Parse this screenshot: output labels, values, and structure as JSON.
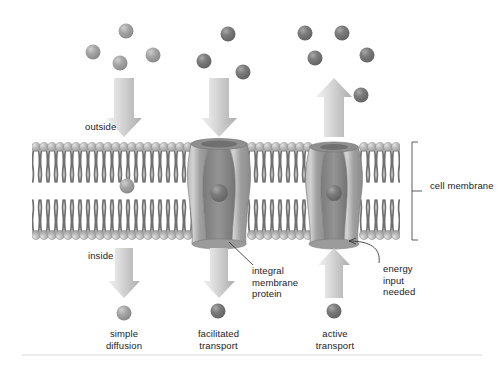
{
  "figure": {
    "background_color": "#ffffff"
  },
  "labels": {
    "outside": "outside",
    "inside": "inside",
    "cell_membrane": "cell membrane",
    "integral_membrane_protein": "integral\nmembrane\nprotein",
    "energy_input_needed": "energy\ninput\nneeded",
    "simple_diffusion": "simple\ndiffusion",
    "facilitated_transport": "facilitated\ntransport",
    "active_transport": "active\ntransport"
  },
  "colors": {
    "particle_light": "#9a9a9a",
    "particle_dark": "#6d6d6d",
    "particle_highlight": "#c9c9c9",
    "arrow_light": "#e6e6e6",
    "arrow_dark": "#b4b4b4",
    "lipid_head": "#b0b0b0",
    "lipid_head_highlight": "#dcdcdc",
    "lipid_tail": "#6f6f6f",
    "protein_body": "#9d9d9d",
    "protein_light": "#c4c4c4",
    "protein_pore": "#7b7b7b",
    "text": "#1c1c1c",
    "leader_line": "#3a3a3a",
    "bracket": "#4a4a4a",
    "footer_rule": "#e3e3e3"
  },
  "membrane": {
    "top_y": 142,
    "bottom_y": 240,
    "left_x": 32,
    "right_x": 400,
    "lipid_count_per_leaflet": 46
  },
  "transport_columns": [
    {
      "name": "simple-diffusion",
      "label": "simple\ndiffusion",
      "direction": "inward",
      "center_x": 124,
      "particle_shade": "light",
      "particles_above": 4,
      "particles_below": 1,
      "has_protein": false,
      "particle_in_bilayer": true
    },
    {
      "name": "facilitated-transport",
      "label": "facilitated\ntransport",
      "direction": "inward",
      "center_x": 222,
      "particle_shade": "dark",
      "particles_above": 3,
      "particles_below": 1,
      "has_protein": true,
      "particle_in_bilayer": false
    },
    {
      "name": "active-transport",
      "label": "active\ntransport",
      "direction": "outward",
      "center_x": 337,
      "particle_shade": "dark",
      "particles_above": 5,
      "particles_below": 1,
      "has_protein": true,
      "particle_in_bilayer": false
    }
  ],
  "particles_above": [
    {
      "cx": 126,
      "cy": 31,
      "r": 7.5,
      "shade": "light"
    },
    {
      "cx": 93,
      "cy": 52,
      "r": 7.5,
      "shade": "light"
    },
    {
      "cx": 120,
      "cy": 63,
      "r": 7.5,
      "shade": "light"
    },
    {
      "cx": 153,
      "cy": 55,
      "r": 7.5,
      "shade": "light"
    },
    {
      "cx": 228,
      "cy": 34,
      "r": 7.5,
      "shade": "dark"
    },
    {
      "cx": 204,
      "cy": 61,
      "r": 7.5,
      "shade": "dark"
    },
    {
      "cx": 243,
      "cy": 72,
      "r": 7.5,
      "shade": "dark"
    },
    {
      "cx": 305,
      "cy": 33,
      "r": 7.5,
      "shade": "dark"
    },
    {
      "cx": 342,
      "cy": 33,
      "r": 7.5,
      "shade": "dark"
    },
    {
      "cx": 315,
      "cy": 58,
      "r": 7.5,
      "shade": "dark"
    },
    {
      "cx": 367,
      "cy": 55,
      "r": 7.5,
      "shade": "dark"
    },
    {
      "cx": 361,
      "cy": 95,
      "r": 7.5,
      "shade": "dark"
    }
  ],
  "particles_in_membrane": [
    {
      "cx": 127,
      "cy": 186,
      "r": 7.5,
      "shade": "light"
    },
    {
      "cx": 218,
      "cy": 193,
      "r": 9,
      "shade": "dark"
    },
    {
      "cx": 333,
      "cy": 193,
      "r": 8,
      "shade": "dark"
    }
  ],
  "particles_below": [
    {
      "cx": 124,
      "cy": 313,
      "r": 7.5,
      "shade": "light"
    },
    {
      "cx": 218,
      "cy": 311,
      "r": 7.5,
      "shade": "dark"
    },
    {
      "cx": 334,
      "cy": 311,
      "r": 7.5,
      "shade": "dark"
    }
  ],
  "arrows": [
    {
      "name": "simple-diffusion-inward-top",
      "x": 124,
      "y_from": 78,
      "y_to": 136,
      "direction": "down",
      "width": 20
    },
    {
      "name": "facilitated-inward-top",
      "x": 219,
      "y_from": 78,
      "y_to": 136,
      "direction": "down",
      "width": 20
    },
    {
      "name": "active-outward-top",
      "x": 334,
      "y_from": 136,
      "y_to": 78,
      "direction": "up",
      "width": 20
    },
    {
      "name": "simple-diffusion-inward-bottom",
      "x": 124,
      "y_from": 248,
      "y_to": 298,
      "direction": "down",
      "width": 18
    },
    {
      "name": "facilitated-inward-bottom",
      "x": 219,
      "y_from": 248,
      "y_to": 298,
      "direction": "down",
      "width": 18
    },
    {
      "name": "active-outward-bottom",
      "x": 334,
      "y_from": 298,
      "y_to": 248,
      "direction": "up",
      "width": 18
    }
  ],
  "proteins": [
    {
      "name": "facilitated-transport-protein",
      "center_x": 219,
      "top_width": 56,
      "waist_width": 34,
      "bottom_width": 52
    },
    {
      "name": "active-transport-protein",
      "center_x": 334,
      "top_width": 44,
      "waist_width": 32,
      "bottom_width": 50
    }
  ],
  "annotations": {
    "protein_leader": {
      "from_x": 231,
      "from_y": 241,
      "to_x": 252,
      "to_y": 262
    },
    "energy_curve": {
      "from_x": 376,
      "from_y": 262,
      "to_x": 345,
      "to_y": 243
    },
    "bracket": {
      "x": 412,
      "top_y": 142,
      "bottom_y": 240,
      "tick_x": 424,
      "tick_y": 191
    }
  }
}
